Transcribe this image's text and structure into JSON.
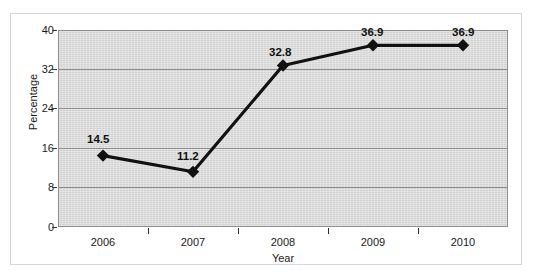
{
  "chart_data": {
    "type": "line",
    "title": "",
    "subtitle": "",
    "xlabel": "Year",
    "ylabel": "Percentage",
    "categories": [
      "2006",
      "2007",
      "2008",
      "2009",
      "2010"
    ],
    "values": [
      14.5,
      11.2,
      32.8,
      36.9,
      36.9
    ],
    "data_labels": [
      "14.5",
      "11.2",
      "32.8",
      "36.9",
      "36.9"
    ],
    "series": [
      {
        "name": "Percentage",
        "values": [
          14.5,
          11.2,
          32.8,
          36.9,
          36.9
        ],
        "marker": "diamond",
        "color": "#111111"
      }
    ],
    "ylim": [
      0,
      40
    ],
    "yticks": [
      0,
      8,
      16,
      24,
      32,
      40
    ],
    "ytick_labels": [
      "0",
      "8",
      "16",
      "24",
      "32",
      "40"
    ],
    "xtick_labels": [
      "2006",
      "2007",
      "2008",
      "2009",
      "2010"
    ],
    "grid": true,
    "grid_axis": "y",
    "legend": false,
    "legend_position": "none",
    "plot_background": "#d9d9d9",
    "grid_color": "#8e8e8e",
    "line_color": "#111111",
    "axis_text_color": "#1a1a1a"
  },
  "axes": {
    "y": {
      "title": "Percentage",
      "ticks": [
        {
          "label": "40",
          "value": 40
        },
        {
          "label": "32",
          "value": 32
        },
        {
          "label": "24",
          "value": 24
        },
        {
          "label": "16",
          "value": 16
        },
        {
          "label": "8",
          "value": 8
        },
        {
          "label": "0",
          "value": 0
        }
      ]
    },
    "x": {
      "title": "Year",
      "ticks": [
        {
          "label": "2006"
        },
        {
          "label": "2007"
        },
        {
          "label": "2008"
        },
        {
          "label": "2009"
        },
        {
          "label": "2010"
        }
      ]
    }
  }
}
